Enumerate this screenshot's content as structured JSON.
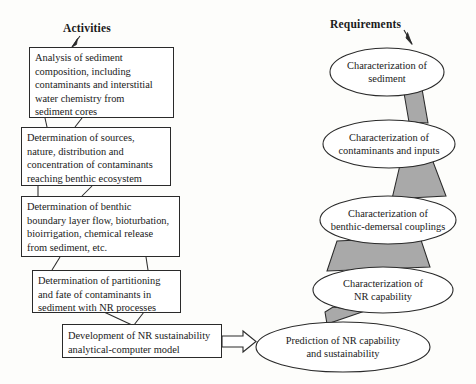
{
  "figure": {
    "type": "flow-diagram",
    "columns": [
      {
        "id": "activities",
        "title": "Activities"
      },
      {
        "id": "requirements",
        "title": "Requirements"
      }
    ]
  },
  "activities": {
    "title": "Activities",
    "boxes": [
      {
        "id": "box-1",
        "lines": [
          "Analysis of sediment",
          "composition, including",
          "contaminants and interstitial",
          "water chemistry from",
          "sediment cores"
        ]
      },
      {
        "id": "box-2",
        "lines": [
          "Determination of sources,",
          "nature, distribution and",
          "concentration of contaminants",
          "reaching benthic ecosystem"
        ]
      },
      {
        "id": "box-3",
        "lines": [
          "Determination of benthic",
          "boundary layer flow, bioturbation,",
          "bioirrigation, chemical release",
          "from sediment, etc."
        ]
      },
      {
        "id": "box-4",
        "lines": [
          "Determination of partitioning",
          "and fate of contaminants in",
          "sediment with NR processes"
        ]
      },
      {
        "id": "box-5",
        "lines": [
          "Development of NR sustainability",
          "analytical-computer model"
        ]
      }
    ]
  },
  "requirements": {
    "title": "Requirements",
    "ellipses": [
      {
        "id": "ellipse-1",
        "lines": [
          "Characterization of",
          "sediment"
        ]
      },
      {
        "id": "ellipse-2",
        "lines": [
          "Characterization of",
          "contaminants and inputs"
        ]
      },
      {
        "id": "ellipse-3",
        "lines": [
          "Characterization of",
          "benthic-demersal couplings"
        ]
      },
      {
        "id": "ellipse-4",
        "lines": [
          "Characterization of",
          "NR capability"
        ]
      },
      {
        "id": "ellipse-5",
        "lines": [
          "Prediction of NR capability",
          "and sustainability"
        ]
      }
    ]
  },
  "colors": {
    "background": "#fdfdfb",
    "stroke": "#2a2a2a",
    "shape_fill": "#ffffff",
    "connector_gray": "#a9a9a9",
    "text": "#1a1a1a"
  }
}
